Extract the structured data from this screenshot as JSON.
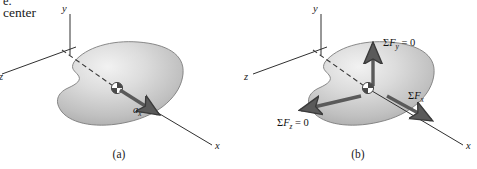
{
  "figure": {
    "background_color": "#ffffff",
    "width": 477,
    "height": 169,
    "clipped_header": {
      "line_top": "e.",
      "line_main": "center"
    }
  },
  "colors": {
    "blob_light": "#e9e9e9",
    "blob_mid": "#c9c9c9",
    "blob_dark": "#9a9a9a",
    "blob_outline": "#6f6f6f",
    "axis_line": "#303030",
    "arrow_dark": "#5a5a5a",
    "arrow_outline": "#3a3a3a",
    "text": "#1a1a1a",
    "dashed_line": "#3a3a3a"
  },
  "panels": [
    {
      "id": "a",
      "caption": "(a)",
      "axes": [
        {
          "name": "y-axis",
          "label": "y"
        },
        {
          "name": "x-axis",
          "label": "x"
        },
        {
          "name": "z-axis",
          "label": "z"
        }
      ],
      "center_of_mass": {
        "name": "center-of-mass-marker",
        "description": "quartered circle symbol"
      },
      "dashed_line": {
        "name": "x-axis-dashed-through-body"
      },
      "vectors": [
        {
          "name": "acceleration-vector",
          "label_base": "a",
          "label_sub": "x",
          "direction": "along +x",
          "color": "#5a5a5a"
        }
      ]
    },
    {
      "id": "b",
      "caption": "(b)",
      "axes": [
        {
          "name": "y-axis",
          "label": "y"
        },
        {
          "name": "x-axis",
          "label": "x"
        },
        {
          "name": "z-axis",
          "label": "z"
        }
      ],
      "center_of_mass": {
        "name": "center-of-mass-marker",
        "description": "quartered circle symbol"
      },
      "dashed_line": {
        "name": "x-axis-dashed-through-body"
      },
      "vectors": [
        {
          "name": "sum-forces-y-vector",
          "sigma": "Σ",
          "base": "F",
          "sub": "y",
          "equals": " = 0",
          "direction": "up (+y)",
          "color": "#5a5a5a"
        },
        {
          "name": "sum-forces-z-vector",
          "sigma": "Σ",
          "base": "F",
          "sub": "z",
          "equals": " = 0",
          "direction": "left (+z)",
          "color": "#5a5a5a"
        },
        {
          "name": "sum-forces-x-vector",
          "sigma": "Σ",
          "base": "F",
          "sub": "x",
          "equals": "",
          "direction": "along +x",
          "color": "#5a5a5a"
        }
      ]
    }
  ]
}
